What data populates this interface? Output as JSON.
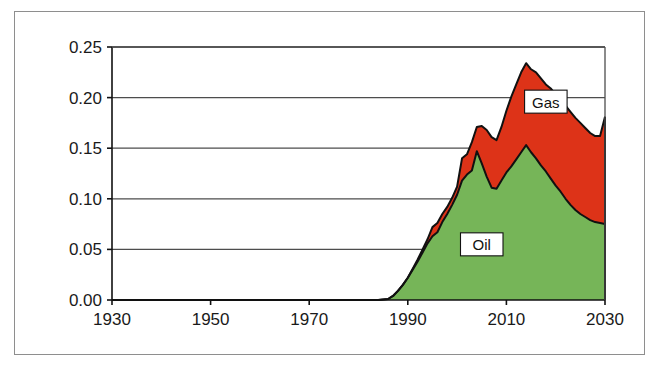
{
  "figure": {
    "background_color": "#ffffff",
    "frame_color": "#8e8e8e"
  },
  "chart_data": {
    "type": "area",
    "stacked": true,
    "title": "",
    "subtitle": "",
    "xlabel": "",
    "ylabel": "Gboe",
    "xlim": [
      1930,
      2030
    ],
    "ylim": [
      0.0,
      0.25
    ],
    "xticks": [
      1930,
      1950,
      1970,
      1990,
      2010,
      2030
    ],
    "xticklabels": [
      "1930",
      "1950",
      "1970",
      "1990",
      "2010",
      "2030"
    ],
    "yticks": [
      0.0,
      0.05,
      0.1,
      0.15,
      0.2,
      0.25
    ],
    "yticklabels": [
      "0.00",
      "0.05",
      "0.10",
      "0.15",
      "0.20",
      "0.25"
    ],
    "grid": "horizontal",
    "legend_position": "inline-annotations",
    "colors": {
      "oil": "#76b558",
      "gas": "#dd3318",
      "outline": "#111111",
      "gridline": "#4d4d4d",
      "axis": "#111111"
    },
    "annotations": [
      {
        "label": "Gas",
        "x": 2018,
        "y": 0.196,
        "series": "gas"
      },
      {
        "label": "Oil",
        "x": 2005,
        "y": 0.055,
        "series": "oil"
      }
    ],
    "x": [
      1930,
      1940,
      1950,
      1960,
      1970,
      1980,
      1984,
      1986,
      1987,
      1988,
      1989,
      1990,
      1991,
      1992,
      1993,
      1994,
      1995,
      1996,
      1997,
      1998,
      1999,
      2000,
      2001,
      2002,
      2003,
      2004,
      2005,
      2006,
      2007,
      2008,
      2009,
      2010,
      2011,
      2012,
      2013,
      2014,
      2015,
      2016,
      2017,
      2018,
      2019,
      2020,
      2021,
      2022,
      2023,
      2024,
      2025,
      2026,
      2027,
      2028,
      2029,
      2030
    ],
    "series": [
      {
        "name": "Oil",
        "color": "#76b558",
        "values": [
          0.0,
          0.0,
          0.0,
          0.0,
          0.0,
          0.0,
          0.0,
          0.001,
          0.004,
          0.009,
          0.015,
          0.022,
          0.03,
          0.038,
          0.047,
          0.056,
          0.063,
          0.067,
          0.077,
          0.085,
          0.094,
          0.104,
          0.118,
          0.124,
          0.128,
          0.147,
          0.135,
          0.122,
          0.111,
          0.11,
          0.118,
          0.126,
          0.132,
          0.139,
          0.146,
          0.153,
          0.146,
          0.14,
          0.133,
          0.127,
          0.12,
          0.113,
          0.107,
          0.1,
          0.094,
          0.089,
          0.085,
          0.082,
          0.079,
          0.077,
          0.076,
          0.075
        ]
      },
      {
        "name": "Gas",
        "color": "#dd3318",
        "values": [
          0.0,
          0.0,
          0.0,
          0.0,
          0.0,
          0.0,
          0.0,
          0.0,
          0.0,
          0.0,
          0.0,
          0.0,
          0.001,
          0.002,
          0.003,
          0.004,
          0.009,
          0.009,
          0.008,
          0.007,
          0.007,
          0.008,
          0.022,
          0.02,
          0.028,
          0.024,
          0.037,
          0.046,
          0.05,
          0.048,
          0.053,
          0.061,
          0.069,
          0.074,
          0.079,
          0.081,
          0.082,
          0.085,
          0.086,
          0.086,
          0.089,
          0.09,
          0.091,
          0.092,
          0.092,
          0.091,
          0.09,
          0.088,
          0.086,
          0.085,
          0.086,
          0.106
        ]
      }
    ],
    "stacked_totals": [
      0.0,
      0.0,
      0.0,
      0.0,
      0.0,
      0.0,
      0.0,
      0.001,
      0.004,
      0.009,
      0.015,
      0.022,
      0.031,
      0.04,
      0.05,
      0.06,
      0.072,
      0.076,
      0.085,
      0.092,
      0.101,
      0.112,
      0.14,
      0.144,
      0.156,
      0.171,
      0.172,
      0.168,
      0.161,
      0.158,
      0.171,
      0.187,
      0.201,
      0.213,
      0.225,
      0.234,
      0.228,
      0.225,
      0.219,
      0.213,
      0.209,
      0.203,
      0.198,
      0.192,
      0.186,
      0.18,
      0.175,
      0.17,
      0.165,
      0.162,
      0.162,
      0.181
    ]
  }
}
